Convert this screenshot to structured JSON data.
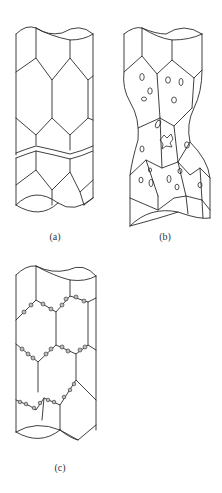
{
  "figure": {
    "width": 222,
    "height": 493,
    "line_color": "#2a2a2a",
    "particle_fill": "#bdbdbd",
    "panels": [
      {
        "id": "a",
        "label": "(a)",
        "description": "Cylindrical specimen with elongated hexagonal grains and a transverse intergranular crack"
      },
      {
        "id": "b",
        "label": "(b)",
        "description": "Necked specimen with cavities/voids inside grains"
      },
      {
        "id": "c",
        "label": "(c)",
        "description": "Cylindrical specimen with particles decorating grain boundaries"
      }
    ]
  }
}
